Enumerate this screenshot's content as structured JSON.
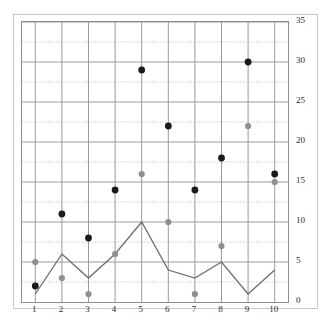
{
  "chart_data": {
    "type": "scatter",
    "title": "",
    "subtitle": "",
    "xlabel": "",
    "ylabel": "",
    "x": [
      1,
      2,
      3,
      4,
      5,
      6,
      7,
      8,
      9,
      10
    ],
    "categories": [
      "1",
      "2",
      "3",
      "4",
      "5",
      "6",
      "7",
      "8",
      "9",
      "10"
    ],
    "xlim": [
      0.5,
      10.5
    ],
    "ylim": [
      0,
      35
    ],
    "xticks": [
      1,
      2,
      3,
      4,
      5,
      6,
      7,
      8,
      9,
      10
    ],
    "xtick_labels": [
      "1",
      "2",
      "3",
      "4",
      "5",
      "6",
      "7",
      "8",
      "9",
      "10"
    ],
    "yticks": [
      0,
      5,
      10,
      15,
      20,
      25,
      30,
      35
    ],
    "ytick_labels": [
      "0",
      "5",
      "10",
      "15",
      "20",
      "25",
      "30",
      "35"
    ],
    "y_axis_position": "right",
    "x_axis_position": "bottom",
    "grid": {
      "major_horizontal": true,
      "minor_horizontal_dotted": true,
      "major_vertical": true,
      "minor_y_values": [
        2.5,
        7.5,
        12.5,
        17.5,
        22.5,
        27.5,
        32.5
      ]
    },
    "legend": {
      "visible": false,
      "position": "none",
      "entries": []
    },
    "series": [
      {
        "name": "black-markers",
        "type": "scatter",
        "marker": "circle",
        "color": "#1a1a1a",
        "values": [
          2,
          11,
          8,
          14,
          29,
          22,
          14,
          18,
          30,
          16
        ]
      },
      {
        "name": "gray-markers",
        "type": "scatter",
        "marker": "circle",
        "color": "#8f8f8f",
        "values": [
          5,
          3,
          1,
          6,
          16,
          10,
          1,
          7,
          22,
          15
        ]
      },
      {
        "name": "gray-line",
        "type": "line",
        "marker": "none",
        "color": "#6e6e6e",
        "values": [
          1,
          6,
          3,
          6,
          10,
          4,
          3,
          5,
          1,
          4
        ]
      }
    ],
    "colors": {
      "background": "#ffffff",
      "plot_border": "#8d8d8d",
      "outer_border": "#c9c9c9",
      "major_gridline": "#9a9a9a",
      "minor_gridline": "#bdbdbd",
      "black_marker": "#1a1a1a",
      "gray_marker": "#8f8f8f",
      "line": "#6e6e6e",
      "tick_label": "#2b2b2b"
    }
  }
}
